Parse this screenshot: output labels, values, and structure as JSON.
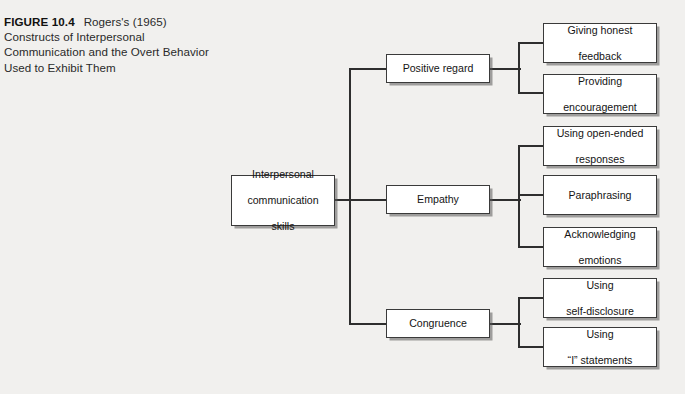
{
  "figure": {
    "label": "FIGURE 10.4",
    "title_line1": "Rogers's (1965)",
    "title_line2": "Constructs of Interpersonal",
    "title_line3": "Communication and the Overt Behavior",
    "title_line4": "Used to Exhibit Them"
  },
  "colors": {
    "page_background": "#f1f0ee",
    "box_fill": "#ffffff",
    "box_border": "#3a3a3a",
    "connector": "#2e2e2e",
    "text": "#141414"
  },
  "diagram": {
    "type": "tree",
    "orientation": "left-to-right",
    "root": {
      "id": "interpersonal-communication-skills",
      "line1": "Interpersonal",
      "line2": "communication",
      "line3": "skills"
    },
    "branches": [
      {
        "id": "positive-regard",
        "label": "Positive regard",
        "children": [
          {
            "id": "giving-honest-feedback",
            "line1": "Giving honest",
            "line2": "feedback"
          },
          {
            "id": "providing-encouragement",
            "line1": "Providing",
            "line2": "encouragement"
          }
        ]
      },
      {
        "id": "empathy",
        "label": "Empathy",
        "children": [
          {
            "id": "using-open-ended-responses",
            "line1": "Using open-ended",
            "line2": "responses"
          },
          {
            "id": "paraphrasing",
            "line1": "Paraphrasing",
            "line2": ""
          },
          {
            "id": "acknowledging-emotions",
            "line1": "Acknowledging",
            "line2": "emotions"
          }
        ]
      },
      {
        "id": "congruence",
        "label": "Congruence",
        "children": [
          {
            "id": "using-self-disclosure",
            "line1": "Using",
            "line2": "self-disclosure"
          },
          {
            "id": "using-i-statements",
            "line1": "Using",
            "line2": "“I” statements"
          }
        ]
      }
    ]
  }
}
